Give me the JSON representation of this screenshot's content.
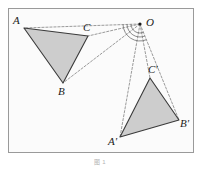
{
  "figure": {
    "caption": "图 1",
    "frame": {
      "x": 8,
      "y": 8,
      "width": 185,
      "height": 144,
      "stroke": "#9a9a9a",
      "fill": "#fbfbfb"
    },
    "background": "#ffffff",
    "triangle_fill": "#cdcdcd",
    "triangle_stroke": "#3a3a3a",
    "dashed_stroke": "#8e8e8e",
    "arc_stroke": "#6f6f6f",
    "label_color": "#1a1a1a",
    "center": {
      "name": "O",
      "label": "O",
      "x": 140,
      "y": 24,
      "dot_radius": 1.6
    },
    "triangles": [
      {
        "name": "triangle-abc",
        "vertices": [
          {
            "label": "A",
            "x": 24,
            "y": 28,
            "label_x": 13,
            "label_y": 24
          },
          {
            "label": "B",
            "x": 63,
            "y": 83,
            "label_x": 58,
            "label_y": 95
          },
          {
            "label": "C",
            "x": 88,
            "y": 36,
            "label_x": 83,
            "label_y": 31
          }
        ]
      },
      {
        "name": "triangle-a-prime-b-prime-c-prime",
        "vertices": [
          {
            "label": "A'",
            "x": 120,
            "y": 137,
            "label_x": 108,
            "label_y": 145
          },
          {
            "label": "B'",
            "x": 179,
            "y": 120,
            "label_x": 180,
            "label_y": 127
          },
          {
            "label": "C'",
            "x": 150,
            "y": 78,
            "label_x": 148,
            "label_y": 73
          }
        ]
      }
    ],
    "rays": [
      {
        "name": "ray-o-a",
        "x1": 140,
        "y1": 24,
        "x2": 24,
        "y2": 28
      },
      {
        "name": "ray-o-b",
        "x1": 140,
        "y1": 24,
        "x2": 63,
        "y2": 83
      },
      {
        "name": "ray-o-c",
        "x1": 140,
        "y1": 24,
        "x2": 88,
        "y2": 36
      },
      {
        "name": "ray-o-a-prime",
        "x1": 140,
        "y1": 24,
        "x2": 120,
        "y2": 137
      },
      {
        "name": "ray-o-b-prime",
        "x1": 140,
        "y1": 24,
        "x2": 179,
        "y2": 120
      },
      {
        "name": "ray-o-c-prime",
        "x1": 140,
        "y1": 24,
        "x2": 150,
        "y2": 78
      }
    ],
    "angle_arcs": [
      {
        "name": "angle-arc-outer",
        "radius": 17
      },
      {
        "name": "angle-arc-middle",
        "radius": 13
      },
      {
        "name": "angle-arc-inner",
        "radius": 9
      }
    ]
  }
}
